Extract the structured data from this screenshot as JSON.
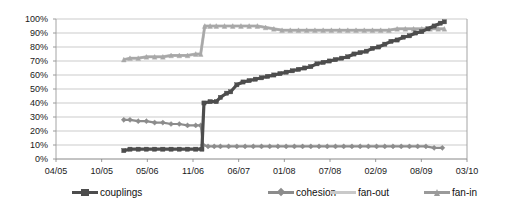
{
  "chart_data": {
    "type": "line",
    "title": "",
    "subtitle": "",
    "xlabel": "",
    "ylabel": "",
    "ylim": [
      0,
      100
    ],
    "ytick_labels": [
      "0%",
      "10%",
      "20%",
      "30%",
      "40%",
      "50%",
      "60%",
      "70%",
      "80%",
      "90%",
      "100%"
    ],
    "ytick_values": [
      0,
      10,
      20,
      30,
      40,
      50,
      60,
      70,
      80,
      90,
      100
    ],
    "xtick_labels": [
      "04/05",
      "10/05",
      "05/06",
      "11/06",
      "06/07",
      "01/08",
      "07/08",
      "02/09",
      "08/09",
      "03/10"
    ],
    "grid": "horizontal",
    "legend_position": "bottom",
    "x_range_label_first": "04/05",
    "x_range_label_last": "03/10",
    "series": [
      {
        "name": "couplings",
        "color": "#4d4d4d",
        "marker": "square",
        "values": [
          [
            0.165,
            6
          ],
          [
            0.18,
            7
          ],
          [
            0.2,
            7
          ],
          [
            0.22,
            7
          ],
          [
            0.24,
            7
          ],
          [
            0.26,
            7
          ],
          [
            0.28,
            7
          ],
          [
            0.3,
            7
          ],
          [
            0.32,
            7
          ],
          [
            0.34,
            7
          ],
          [
            0.355,
            7
          ],
          [
            0.36,
            40
          ],
          [
            0.375,
            41
          ],
          [
            0.39,
            41
          ],
          [
            0.4,
            44
          ],
          [
            0.415,
            47
          ],
          [
            0.425,
            48
          ],
          [
            0.44,
            53
          ],
          [
            0.455,
            55
          ],
          [
            0.47,
            56
          ],
          [
            0.485,
            57
          ],
          [
            0.5,
            58
          ],
          [
            0.515,
            59
          ],
          [
            0.53,
            60
          ],
          [
            0.545,
            61
          ],
          [
            0.56,
            62
          ],
          [
            0.575,
            63
          ],
          [
            0.59,
            64
          ],
          [
            0.605,
            65
          ],
          [
            0.62,
            66
          ],
          [
            0.635,
            68
          ],
          [
            0.65,
            69
          ],
          [
            0.665,
            70
          ],
          [
            0.68,
            71
          ],
          [
            0.695,
            72
          ],
          [
            0.71,
            73
          ],
          [
            0.725,
            75
          ],
          [
            0.74,
            76
          ],
          [
            0.755,
            77
          ],
          [
            0.77,
            79
          ],
          [
            0.785,
            80
          ],
          [
            0.8,
            82
          ],
          [
            0.815,
            84
          ],
          [
            0.83,
            85
          ],
          [
            0.845,
            87
          ],
          [
            0.86,
            88
          ],
          [
            0.875,
            90
          ],
          [
            0.89,
            91
          ],
          [
            0.905,
            93
          ],
          [
            0.92,
            95
          ],
          [
            0.935,
            97
          ],
          [
            0.945,
            98
          ]
        ]
      },
      {
        "name": "cohesion",
        "color": "#8c8c8c",
        "marker": "diamond",
        "values": [
          [
            0.165,
            28
          ],
          [
            0.18,
            28
          ],
          [
            0.2,
            27
          ],
          [
            0.22,
            27
          ],
          [
            0.24,
            26
          ],
          [
            0.26,
            26
          ],
          [
            0.28,
            25
          ],
          [
            0.3,
            25
          ],
          [
            0.32,
            24
          ],
          [
            0.34,
            24
          ],
          [
            0.352,
            24
          ],
          [
            0.358,
            10
          ],
          [
            0.37,
            9
          ],
          [
            0.385,
            9
          ],
          [
            0.4,
            9
          ],
          [
            0.42,
            9
          ],
          [
            0.44,
            9
          ],
          [
            0.46,
            9
          ],
          [
            0.48,
            9
          ],
          [
            0.5,
            9
          ],
          [
            0.52,
            9
          ],
          [
            0.54,
            9
          ],
          [
            0.56,
            9
          ],
          [
            0.58,
            9
          ],
          [
            0.6,
            9
          ],
          [
            0.62,
            9
          ],
          [
            0.64,
            9
          ],
          [
            0.66,
            9
          ],
          [
            0.68,
            9
          ],
          [
            0.7,
            9
          ],
          [
            0.72,
            9
          ],
          [
            0.74,
            9
          ],
          [
            0.76,
            9
          ],
          [
            0.78,
            9
          ],
          [
            0.8,
            9
          ],
          [
            0.82,
            9
          ],
          [
            0.84,
            9
          ],
          [
            0.86,
            9
          ],
          [
            0.88,
            9
          ],
          [
            0.9,
            9
          ],
          [
            0.92,
            8
          ],
          [
            0.94,
            8
          ]
        ]
      },
      {
        "name": "fan-out",
        "color": "#c0c0c0",
        "marker": "none",
        "values": [
          [
            0.165,
            71
          ],
          [
            0.18,
            72
          ],
          [
            0.2,
            72
          ],
          [
            0.22,
            73
          ],
          [
            0.24,
            73
          ],
          [
            0.26,
            73
          ],
          [
            0.28,
            74
          ],
          [
            0.3,
            74
          ],
          [
            0.32,
            74
          ],
          [
            0.34,
            75
          ],
          [
            0.352,
            75
          ],
          [
            0.362,
            95
          ],
          [
            0.375,
            95
          ],
          [
            0.39,
            95
          ],
          [
            0.41,
            95
          ],
          [
            0.43,
            95
          ],
          [
            0.45,
            95
          ],
          [
            0.47,
            95
          ],
          [
            0.49,
            95
          ],
          [
            0.51,
            94
          ],
          [
            0.53,
            93
          ],
          [
            0.55,
            92
          ],
          [
            0.57,
            92
          ],
          [
            0.59,
            92
          ],
          [
            0.61,
            92
          ],
          [
            0.63,
            92
          ],
          [
            0.65,
            92
          ],
          [
            0.67,
            92
          ],
          [
            0.69,
            92
          ],
          [
            0.71,
            92
          ],
          [
            0.73,
            92
          ],
          [
            0.75,
            92
          ],
          [
            0.77,
            92
          ],
          [
            0.79,
            92
          ],
          [
            0.81,
            92
          ],
          [
            0.83,
            93
          ],
          [
            0.85,
            93
          ],
          [
            0.87,
            93
          ],
          [
            0.89,
            93
          ],
          [
            0.91,
            93
          ],
          [
            0.93,
            93
          ],
          [
            0.945,
            93
          ]
        ]
      },
      {
        "name": "fan-in",
        "color": "#a8a8a8",
        "marker": "triangle",
        "values": [
          [
            0.165,
            71
          ],
          [
            0.18,
            72
          ],
          [
            0.2,
            72
          ],
          [
            0.22,
            73
          ],
          [
            0.24,
            73
          ],
          [
            0.26,
            73
          ],
          [
            0.28,
            74
          ],
          [
            0.3,
            74
          ],
          [
            0.32,
            74
          ],
          [
            0.34,
            75
          ],
          [
            0.352,
            75
          ],
          [
            0.362,
            95
          ],
          [
            0.375,
            95
          ],
          [
            0.39,
            95
          ],
          [
            0.41,
            95
          ],
          [
            0.43,
            95
          ],
          [
            0.45,
            95
          ],
          [
            0.47,
            95
          ],
          [
            0.49,
            95
          ],
          [
            0.51,
            94
          ],
          [
            0.53,
            93
          ],
          [
            0.55,
            92
          ],
          [
            0.57,
            92
          ],
          [
            0.59,
            92
          ],
          [
            0.61,
            92
          ],
          [
            0.63,
            92
          ],
          [
            0.65,
            92
          ],
          [
            0.67,
            92
          ],
          [
            0.69,
            92
          ],
          [
            0.71,
            92
          ],
          [
            0.73,
            92
          ],
          [
            0.75,
            92
          ],
          [
            0.77,
            92
          ],
          [
            0.79,
            92
          ],
          [
            0.81,
            92
          ],
          [
            0.83,
            93
          ],
          [
            0.85,
            93
          ],
          [
            0.87,
            93
          ],
          [
            0.89,
            93
          ],
          [
            0.91,
            93
          ],
          [
            0.93,
            93
          ],
          [
            0.945,
            93
          ]
        ]
      }
    ]
  },
  "legend": {
    "items": [
      {
        "label": "couplings",
        "color": "#4d4d4d",
        "marker": "square"
      },
      {
        "label": "cohesion",
        "color": "#8c8c8c",
        "marker": "diamond"
      },
      {
        "label": "fan-out",
        "color": "#c9c9c9",
        "marker": "none"
      },
      {
        "label": "fan-in",
        "color": "#9a9a9a",
        "marker": "triangle"
      }
    ]
  },
  "axis": {
    "plot_border_color": "#9a9a9a",
    "grid_color": "#b5b5b5",
    "tick_color": "#808080"
  }
}
